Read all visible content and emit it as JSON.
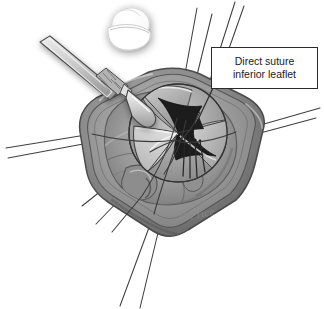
{
  "figure": {
    "domain_label": "surgical-illustration",
    "background_color": "#ffffff",
    "style": "grayscale medical line-and-tone illustration"
  },
  "callout": {
    "line1": "Direct suture",
    "line2": "inferior leaflet",
    "border_color": "#2b2b2b",
    "fill_color": "#ffffff",
    "text_color": "#1a1a1a",
    "leader_line_color": "#2a2a2a",
    "arrowhead": "filled-triangle"
  },
  "watermark": {
    "copyright": "©2008",
    "artist": "G.Price",
    "color": "#8d8d8d"
  },
  "palette": {
    "tissue_outer_rim": "#6e6e6e",
    "tissue_mid": "#8a8a8a",
    "tissue_light": "#b4b4b4",
    "tissue_highlight": "#cfcfcf",
    "tissue_shadow": "#5a5a5a",
    "valve_orifice_dark": "#1c1c1c",
    "leaflet_gray": "#9a9a9a",
    "leaflet_light": "#dcdcdc",
    "suture_thread": "#4a4a4a",
    "instrument_metal": "#d8d8d8",
    "instrument_edge": "#4f4f4f",
    "inset_white": "#fdfdfd",
    "inset_shadow": "#b9b9b9",
    "outline": "#3a3a3a"
  },
  "elements": {
    "inset_diagram_name": "valve-schematic-inset",
    "inset_description": "small white rounded valve schematic with soft drop shadow",
    "scalpel_name": "scalpel-instrument",
    "scalpel_description": "scalpel with knurled grip and blade entering the operative field",
    "aortotomy_name": "aortotomy-opening",
    "aortotomy_description": "pentagonal retracted aortic wall opening exposing the valve",
    "valve_name": "aortic-valve",
    "valve_description": "circular aortic valve with three leaflets and dark central orifice",
    "suture_group_name": "retraction-sutures",
    "suture_count": 13
  },
  "annotations": {
    "valve_orifice": "central triangular valve orifice",
    "inferior_leaflet": "inferior leaflet targeted for direct suture",
    "sinus_left": "left coronary sinus",
    "sinus_right": "right coronary sinus",
    "needle_sutures": "fine needle sutures placed through inferior leaflet"
  }
}
